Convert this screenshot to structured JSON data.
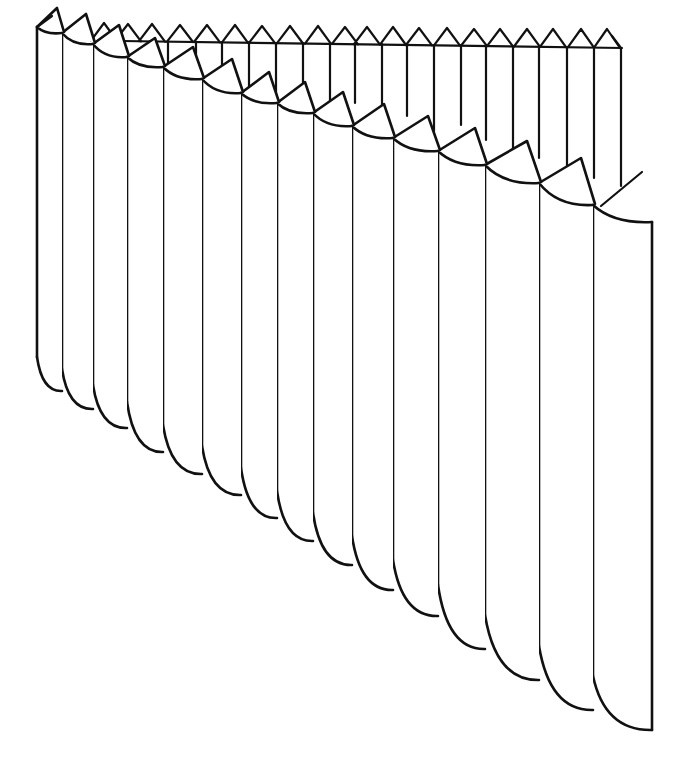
{
  "figure": {
    "ink_color": "#111111",
    "background": "#ffffff"
  },
  "back_row": {
    "baseline": {
      "x1": 122,
      "y1": 41,
      "x2": 622,
      "y2": 48
    },
    "peaks": [
      {
        "x": 104,
        "y": 23
      },
      {
        "x": 128,
        "y": 24
      },
      {
        "x": 152,
        "y": 24
      },
      {
        "x": 180,
        "y": 25
      },
      {
        "x": 207,
        "y": 25
      },
      {
        "x": 235,
        "y": 25
      },
      {
        "x": 262,
        "y": 26
      },
      {
        "x": 290,
        "y": 26
      },
      {
        "x": 318,
        "y": 26
      },
      {
        "x": 345,
        "y": 27
      },
      {
        "x": 367,
        "y": 27
      },
      {
        "x": 393,
        "y": 27
      },
      {
        "x": 419,
        "y": 28
      },
      {
        "x": 447,
        "y": 28
      },
      {
        "x": 474,
        "y": 29
      },
      {
        "x": 500,
        "y": 29
      },
      {
        "x": 527,
        "y": 29
      },
      {
        "x": 553,
        "y": 29
      },
      {
        "x": 581,
        "y": 29
      },
      {
        "x": 607,
        "y": 29
      }
    ],
    "verticals": [
      {
        "x": 150,
        "top": 41,
        "bottom": 55
      },
      {
        "x": 168,
        "top": 41,
        "bottom": 64
      },
      {
        "x": 196,
        "top": 42,
        "bottom": 65
      },
      {
        "x": 222,
        "top": 42,
        "bottom": 75
      },
      {
        "x": 249,
        "top": 42,
        "bottom": 88
      },
      {
        "x": 276,
        "top": 43,
        "bottom": 97
      },
      {
        "x": 303,
        "top": 43,
        "bottom": 105
      },
      {
        "x": 330,
        "top": 43,
        "bottom": 112
      },
      {
        "x": 355,
        "top": 44,
        "bottom": 103
      },
      {
        "x": 382,
        "top": 44,
        "bottom": 128
      },
      {
        "x": 407,
        "top": 45,
        "bottom": 116
      },
      {
        "x": 434,
        "top": 45,
        "bottom": 131
      },
      {
        "x": 461,
        "top": 45,
        "bottom": 125
      },
      {
        "x": 486,
        "top": 46,
        "bottom": 140
      },
      {
        "x": 513,
        "top": 46,
        "bottom": 150
      },
      {
        "x": 539,
        "top": 47,
        "bottom": 158
      },
      {
        "x": 567,
        "top": 47,
        "bottom": 168
      },
      {
        "x": 594,
        "top": 47,
        "bottom": 178
      },
      {
        "x": 621,
        "top": 48,
        "bottom": 186
      }
    ],
    "end_tick": {
      "x1": 612,
      "y1": 36,
      "x2": 621,
      "y2": 48
    },
    "diagonal": {
      "x1": 601,
      "y1": 206,
      "x2": 642,
      "y2": 172
    }
  },
  "front_row": {
    "pleats": [
      {
        "x": 37,
        "top": 27,
        "w": 25,
        "bottom": 377,
        "drop": 6,
        "apex_dx": 20,
        "apex_dy": -15
      },
      {
        "x": 62,
        "top": 33,
        "w": 31,
        "bottom": 391,
        "drop": 8,
        "apex_dx": 24,
        "apex_dy": -15
      },
      {
        "x": 93,
        "top": 44,
        "w": 34,
        "bottom": 409,
        "drop": 10,
        "apex_dx": 26,
        "apex_dy": -15
      },
      {
        "x": 127,
        "top": 57,
        "w": 36,
        "bottom": 428,
        "drop": 12,
        "apex_dx": 28,
        "apex_dy": -15
      },
      {
        "x": 163,
        "top": 67,
        "w": 39,
        "bottom": 452,
        "drop": 13,
        "apex_dx": 30,
        "apex_dy": -16
      },
      {
        "x": 202,
        "top": 79,
        "w": 39,
        "bottom": 474,
        "drop": 14,
        "apex_dx": 30,
        "apex_dy": -16
      },
      {
        "x": 241,
        "top": 93,
        "w": 36,
        "bottom": 495,
        "drop": 13,
        "apex_dx": 28,
        "apex_dy": -17
      },
      {
        "x": 277,
        "top": 103,
        "w": 36,
        "bottom": 518,
        "drop": 13,
        "apex_dx": 28,
        "apex_dy": -17
      },
      {
        "x": 313,
        "top": 113,
        "w": 39,
        "bottom": 541,
        "drop": 14,
        "apex_dx": 30,
        "apex_dy": -17
      },
      {
        "x": 352,
        "top": 126,
        "w": 41,
        "bottom": 565,
        "drop": 15,
        "apex_dx": 32,
        "apex_dy": -18
      },
      {
        "x": 393,
        "top": 138,
        "w": 45,
        "bottom": 590,
        "drop": 16,
        "apex_dx": 35,
        "apex_dy": -18
      },
      {
        "x": 438,
        "top": 151,
        "w": 47,
        "bottom": 616,
        "drop": 17,
        "apex_dx": 37,
        "apex_dy": -19
      },
      {
        "x": 485,
        "top": 165,
        "w": 54,
        "bottom": 649,
        "drop": 20,
        "apex_dx": 42,
        "apex_dy": -20
      },
      {
        "x": 539,
        "top": 183,
        "w": 54,
        "bottom": 680,
        "drop": 20,
        "apex_dx": 42,
        "apex_dy": -21
      },
      {
        "x": 593,
        "top": 205,
        "w": 59,
        "bottom": 710,
        "drop": 20,
        "apex_dx": 0,
        "apex_dy": 0,
        "last": true
      }
    ],
    "last_right_edge": {
      "x": 652,
      "top": 222,
      "bottom": 730
    }
  },
  "chart_data": null
}
